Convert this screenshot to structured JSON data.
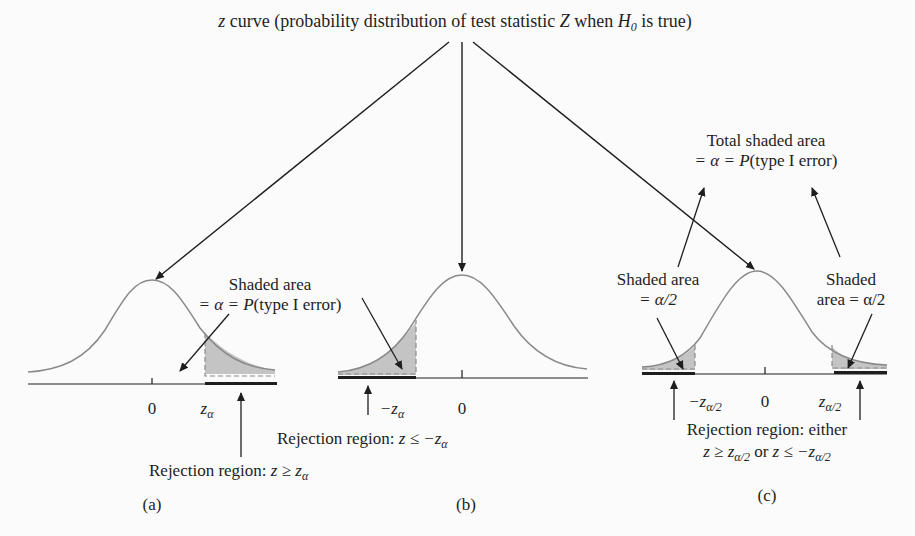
{
  "title": {
    "prefix_italic": "z",
    "text": " curve (probability distribution of test statistic ",
    "stat_italic": "Z",
    "when": " when ",
    "h_italic": "H",
    "h_sub": "0",
    "suffix": " is true)"
  },
  "panels": [
    {
      "id": "a",
      "caption": "(a)",
      "zero_label": "0",
      "crit_label": "z",
      "crit_sub": "α",
      "shade_label_line1": "Shaded area",
      "shade_label_line2_pre": "= α = ",
      "shade_label_line2_p": "P",
      "shade_label_line2_post": "(type I error)",
      "rejection_pre": "Rejection region: ",
      "rejection_expr": "z ≥ z",
      "rejection_sub": "α"
    },
    {
      "id": "b",
      "caption": "(b)",
      "zero_label": "0",
      "crit_label": "−z",
      "crit_sub": "α",
      "rejection_pre": "Rejection region: ",
      "rejection_expr": "z ≤ −z",
      "rejection_sub": "α"
    },
    {
      "id": "c",
      "caption": "(c)",
      "zero_label": "0",
      "left_crit_label": "−z",
      "right_crit_label": "z",
      "crit_sub": "α/2",
      "total_label_line1": "Total shaded area",
      "total_label_line2_pre": "= α = ",
      "total_label_line2_p": "P",
      "total_label_line2_post": "(type I error)",
      "left_shade_line1": "Shaded area",
      "left_shade_line2": "= α/2",
      "right_shade_line1": "Shaded",
      "right_shade_line2": "area = α/2",
      "rejection_line1": "Rejection region: either",
      "rejection_line2_a": "z ≥ z",
      "rejection_line2_or": " or ",
      "rejection_line2_b": "z ≤ −z",
      "rejection_sub": "α/2"
    }
  ],
  "colors": {
    "curve": "#8a8a8a",
    "shade": "#c4c4c4",
    "ink": "#1e1e1e"
  }
}
